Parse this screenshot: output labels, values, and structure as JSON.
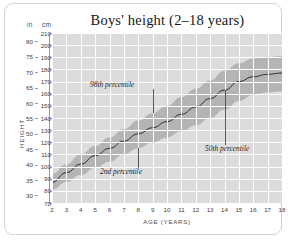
{
  "figure": {
    "title": "Boys' height (2–18 years)",
    "y_label": "HEIGHT",
    "x_label": "AGE (YEARS)",
    "unit_primary": "cm",
    "unit_secondary": "in"
  },
  "colors": {
    "plot_background": "#dcdcdc",
    "gridline": "#ffffff",
    "band": "#b4b4b4",
    "median_line": "#2b2b2b",
    "frame": "#d2d2d2",
    "text": "#1c1c1c"
  },
  "chart_data": {
    "type": "line",
    "title": "Boys' height (2–18 years)",
    "xlabel": "AGE (YEARS)",
    "ylabel": "HEIGHT",
    "grid": true,
    "legend": "annotations-inline",
    "xlim": [
      2,
      18
    ],
    "ylim": [
      70,
      210
    ],
    "y_unit": "cm",
    "y_unit_secondary": "in",
    "xticks": [
      2,
      3,
      4,
      5,
      6,
      7,
      8,
      9,
      10,
      11,
      12,
      13,
      14,
      15,
      16,
      17,
      18
    ],
    "yticks_cm": [
      70,
      80,
      90,
      100,
      110,
      120,
      130,
      140,
      150,
      160,
      170,
      180,
      190,
      200,
      210
    ],
    "yticks_in": [
      30,
      35,
      40,
      45,
      50,
      55,
      60,
      65,
      70,
      75,
      80
    ],
    "x": [
      2,
      3,
      4,
      5,
      6,
      7,
      8,
      9,
      10,
      11,
      12,
      13,
      14,
      15,
      16,
      17,
      18
    ],
    "series": [
      {
        "name": "2nd percentile",
        "values": [
          81,
          87,
          93,
          99,
          104,
          110,
          115,
          120,
          124,
          129,
          134,
          140,
          147,
          154,
          159,
          161,
          162
        ]
      },
      {
        "name": "50th percentile",
        "values": [
          87,
          95,
          102,
          109,
          115,
          121,
          127,
          132,
          137,
          143,
          149,
          156,
          163,
          170,
          174,
          176,
          177
        ]
      },
      {
        "name": "98th percentile",
        "values": [
          94,
          102,
          110,
          117,
          124,
          131,
          138,
          144,
          150,
          157,
          164,
          171,
          179,
          185,
          189,
          190,
          191
        ]
      }
    ],
    "annotations": [
      {
        "text": "98th percentile",
        "target_series": "98th percentile",
        "target_age": 9
      },
      {
        "text": "2nd percentile",
        "target_series": "2nd percentile",
        "target_age": 8
      },
      {
        "text": "50th percentile",
        "target_series": "50th percentile",
        "target_age": 14
      }
    ]
  }
}
